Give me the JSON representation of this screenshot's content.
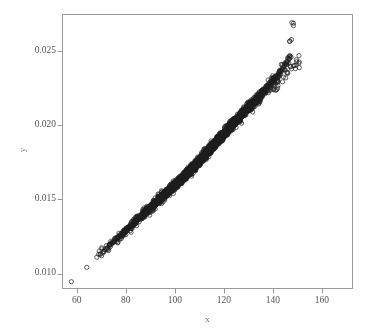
{
  "chart_data": {
    "type": "scatter",
    "title": "",
    "subtitle": "",
    "xlabel": "x",
    "ylabel": "y",
    "xlim": [
      54.2,
      172.5
    ],
    "ylim": [
      0.00899,
      0.02749
    ],
    "xticks": [
      60,
      80,
      100,
      120,
      140,
      160
    ],
    "xtick_labels": [
      "60",
      "80",
      "100",
      "120",
      "140",
      "160"
    ],
    "yticks": [
      0.01,
      0.015,
      0.02,
      0.025
    ],
    "ytick_labels": [
      "0.010",
      "0.015",
      "0.020",
      "0.025"
    ],
    "grid": false,
    "legend": null,
    "annotations": [],
    "marker": {
      "shape": "open-circle",
      "size_px": 4.2,
      "edge_color": "#1d1d1d",
      "fill_color": "none",
      "edge_width": 0.7
    },
    "axes_style": {
      "frame": "box",
      "frame_color": "#9a9a9a",
      "tick_direction": "out",
      "background": "#ffffff"
    },
    "relationship": {
      "description": "tight positive near-linear band",
      "approx_slope": 0.00016,
      "approx_intercept": 0.000195,
      "scatter_sd": 0.00013,
      "n_points": 640
    },
    "x": [
      57.8,
      64.1,
      68.2,
      69.6,
      70.9,
      72.1,
      73.3,
      74.2,
      75.1,
      75.8,
      76.6,
      77.3,
      78.0,
      78.6,
      79.2,
      79.8,
      80.4,
      80.9,
      81.4,
      81.9,
      82.4,
      82.9,
      83.3,
      83.8,
      84.2,
      84.6,
      85.0,
      85.4,
      85.8,
      86.2,
      86.5,
      86.9,
      87.2,
      87.6,
      87.9,
      88.3,
      88.6,
      88.9,
      89.2,
      89.5,
      89.8,
      90.1,
      90.4,
      90.7,
      91.0,
      91.3,
      91.5,
      91.8,
      92.1,
      92.3,
      92.6,
      92.8,
      93.1,
      93.3,
      93.6,
      93.8,
      94.1,
      94.3,
      94.5,
      94.8,
      95.0,
      95.2,
      95.4,
      95.7,
      95.9,
      96.1,
      96.3,
      96.5,
      96.7,
      96.9,
      97.1,
      97.3,
      97.5,
      97.7,
      97.9,
      98.1,
      98.3,
      98.5,
      98.7,
      98.9,
      99.1,
      99.3,
      99.5,
      99.6,
      99.8,
      100.0,
      100.2,
      100.4,
      100.5,
      100.7,
      100.9,
      101.1,
      101.2,
      101.4,
      101.6,
      101.7,
      101.9,
      102.1,
      102.2,
      102.4,
      102.6,
      102.7,
      102.9,
      103.0,
      103.2,
      103.4,
      103.5,
      103.7,
      103.8,
      104.0,
      104.1,
      104.3,
      104.4,
      104.6,
      104.7,
      104.9,
      105.0,
      105.2,
      105.3,
      105.5,
      105.6,
      105.8,
      105.9,
      106.1,
      106.2,
      106.4,
      106.5,
      106.6,
      106.8,
      106.9,
      107.1,
      107.2,
      107.3,
      107.5,
      107.6,
      107.8,
      107.9,
      108.0,
      108.2,
      108.3,
      108.4,
      108.6,
      108.7,
      108.8,
      109.0,
      109.1,
      109.2,
      109.4,
      109.5,
      109.6,
      109.8,
      109.9,
      110.0,
      110.1,
      110.3,
      110.4,
      110.5,
      110.7,
      110.8,
      110.9,
      111.0,
      111.2,
      111.3,
      111.4,
      111.5,
      111.7,
      111.8,
      111.9,
      112.0,
      112.2,
      112.3,
      112.4,
      112.5,
      112.7,
      112.8,
      112.9,
      113.0,
      113.2,
      113.3,
      113.4,
      113.5,
      113.6,
      113.8,
      113.9,
      114.0,
      114.1,
      114.3,
      114.4,
      114.5,
      114.6,
      114.7,
      114.9,
      115.0,
      115.1,
      115.2,
      115.3,
      115.5,
      115.6,
      115.7,
      115.8,
      115.9,
      116.1,
      116.2,
      116.3,
      116.4,
      116.5,
      116.7,
      116.8,
      116.9,
      117.0,
      117.1,
      117.3,
      117.4,
      117.5,
      117.6,
      117.7,
      117.9,
      118.0,
      118.1,
      118.2,
      118.3,
      118.5,
      118.6,
      118.7,
      118.8,
      118.9,
      119.1,
      119.2,
      119.3,
      119.4,
      119.5,
      119.7,
      119.8,
      119.9,
      120.0,
      120.2,
      120.3,
      120.4,
      120.5,
      120.7,
      120.8,
      120.9,
      121.0,
      121.2,
      121.3,
      121.4,
      121.5,
      121.7,
      121.8,
      121.9,
      122.0,
      122.2,
      122.3,
      122.4,
      122.6,
      122.7,
      122.8,
      122.9,
      123.1,
      123.2,
      123.3,
      123.5,
      123.6,
      123.7,
      123.9,
      124.0,
      124.1,
      124.3,
      124.4,
      124.5,
      124.7,
      124.8,
      124.9,
      125.1,
      125.2,
      125.3,
      125.5,
      125.6,
      125.8,
      125.9,
      126.0,
      126.2,
      126.3,
      126.5,
      126.6,
      126.8,
      126.9,
      127.0,
      127.2,
      127.3,
      127.5,
      127.6,
      127.8,
      127.9,
      128.1,
      128.2,
      128.4,
      128.5,
      128.7,
      128.9,
      129.0,
      129.2,
      129.3,
      129.5,
      129.7,
      129.8,
      130.0,
      130.2,
      130.3,
      130.5,
      130.7,
      130.8,
      131.0,
      131.2,
      131.4,
      131.5,
      131.7,
      131.9,
      132.1,
      132.3,
      132.5,
      132.6,
      132.8,
      133.0,
      133.2,
      133.4,
      133.6,
      133.8,
      134.0,
      134.3,
      134.5,
      134.7,
      134.9,
      135.1,
      135.4,
      135.6,
      135.8,
      136.1,
      136.3,
      136.6,
      136.8,
      137.1,
      137.3,
      137.6,
      137.9,
      138.2,
      138.5,
      138.8,
      139.1,
      139.4,
      139.7,
      140.0,
      140.4,
      140.7,
      141.1,
      141.5,
      141.9,
      142.3,
      142.7,
      143.1,
      143.6,
      144.1,
      144.6,
      145.1,
      145.7,
      146.3,
      146.9,
      147.6,
      148.4,
      149.2,
      150.1,
      151.1,
      159.9,
      166.9
    ],
    "y": [
      0.00945,
      0.01042,
      0.0111,
      0.01129,
      0.0115,
      0.01168,
      0.01186,
      0.01199,
      0.01213,
      0.01224,
      0.01236,
      0.01247,
      0.01258,
      0.01267,
      0.01276,
      0.01286,
      0.01295,
      0.01303,
      0.01311,
      0.01318,
      0.01326,
      0.01334,
      0.0134,
      0.01348,
      0.01354,
      0.01361,
      0.01367,
      0.01373,
      0.01379,
      0.01385,
      0.0139,
      0.01396,
      0.01401,
      0.01407,
      0.01412,
      0.01417,
      0.01422,
      0.01427,
      0.01432,
      0.01436,
      0.01441,
      0.01445,
      0.0145,
      0.01454,
      0.01459,
      0.01464,
      0.01467,
      0.01471,
      0.01476,
      0.01479,
      0.01483,
      0.01486,
      0.0149,
      0.01494,
      0.01498,
      0.01501,
      0.01505,
      0.01508,
      0.01511,
      0.01515,
      0.01518,
      0.01521,
      0.01524,
      0.01528,
      0.01531,
      0.01534,
      0.01537,
      0.0154,
      0.01543,
      0.01546,
      0.01549,
      0.01552,
      0.01555,
      0.01558,
      0.01561,
      0.01564,
      0.01567,
      0.0157,
      0.01573,
      0.01576,
      0.01579,
      0.01582,
      0.01585,
      0.01587,
      0.0159,
      0.01593,
      0.01596,
      0.01599,
      0.01601,
      0.01604,
      0.01607,
      0.0161,
      0.01612,
      0.01615,
      0.01618,
      0.0162,
      0.01623,
      0.01626,
      0.01628,
      0.01631,
      0.01634,
      0.01636,
      0.01639,
      0.01641,
      0.01644,
      0.01647,
      0.01649,
      0.01652,
      0.01654,
      0.01657,
      0.01659,
      0.01662,
      0.01664,
      0.01667,
      0.01669,
      0.01672,
      0.01674,
      0.01677,
      0.01679,
      0.01682,
      0.01684,
      0.01687,
      0.01689,
      0.01692,
      0.01694,
      0.01697,
      0.01699,
      0.01702,
      0.01704,
      0.01706,
      0.01709,
      0.01711,
      0.01714,
      0.01716,
      0.01718,
      0.01721,
      0.01723,
      0.01726,
      0.01728,
      0.0173,
      0.01733,
      0.01735,
      0.01737,
      0.0174,
      0.01742,
      0.01744,
      0.01747,
      0.01749,
      0.01751,
      0.01754,
      0.01756,
      0.01758,
      0.01761,
      0.01763,
      0.01765,
      0.01767,
      0.0177,
      0.01772,
      0.01774,
      0.01777,
      0.01779,
      0.01781,
      0.01783,
      0.01786,
      0.01788,
      0.0179,
      0.01792,
      0.01795,
      0.01797,
      0.01799,
      0.01801,
      0.01804,
      0.01806,
      0.01808,
      0.0181,
      0.01813,
      0.01815,
      0.01817,
      0.01819,
      0.01822,
      0.01824,
      0.01826,
      0.01828,
      0.0183,
      0.01833,
      0.01835,
      0.01837,
      0.01839,
      0.01842,
      0.01844,
      0.01846,
      0.01848,
      0.0185,
      0.01853,
      0.01855,
      0.01857,
      0.01859,
      0.01861,
      0.01864,
      0.01866,
      0.01868,
      0.0187,
      0.01872,
      0.01875,
      0.01877,
      0.01879,
      0.01881,
      0.01883,
      0.01886,
      0.01888,
      0.0189,
      0.01892,
      0.01894,
      0.01897,
      0.01899,
      0.01901,
      0.01903,
      0.01905,
      0.01908,
      0.0191,
      0.01912,
      0.01914,
      0.01916,
      0.01919,
      0.01921,
      0.01923,
      0.01925,
      0.01928,
      0.0193,
      0.01932,
      0.01934,
      0.01936,
      0.01939,
      0.01941,
      0.01943,
      0.01945,
      0.01948,
      0.0195,
      0.01952,
      0.01954,
      0.01957,
      0.01959,
      0.01961,
      0.01963,
      0.01966,
      0.01968,
      0.0197,
      0.01972,
      0.01975,
      0.01977,
      0.01979,
      0.01982,
      0.01984,
      0.01986,
      0.01988,
      0.01991,
      0.01993,
      0.01995,
      0.01998,
      0.02,
      0.02002,
      0.02005,
      0.02007,
      0.02009,
      0.02012,
      0.02014,
      0.02016,
      0.02019,
      0.02021,
      0.02023,
      0.02026,
      0.02028,
      0.02031,
      0.02033,
      0.02035,
      0.02038,
      0.0204,
      0.02043,
      0.02045,
      0.02048,
      0.0205,
      0.02053,
      0.02055,
      0.02058,
      0.0206,
      0.02063,
      0.02065,
      0.02068,
      0.0207,
      0.02073,
      0.02075,
      0.02078,
      0.02081,
      0.02083,
      0.02086,
      0.02089,
      0.02091,
      0.02094,
      0.02097,
      0.02099,
      0.02102,
      0.02105,
      0.02108,
      0.0211,
      0.02113,
      0.02116,
      0.02119,
      0.02122,
      0.02125,
      0.02128,
      0.02131,
      0.02134,
      0.02137,
      0.0214,
      0.02143,
      0.02146,
      0.02149,
      0.02153,
      0.02156,
      0.02159,
      0.02162,
      0.02166,
      0.02169,
      0.02173,
      0.02176,
      0.0218,
      0.02183,
      0.02187,
      0.02191,
      0.02194,
      0.02198,
      0.02202,
      0.02206,
      0.0221,
      0.02214,
      0.02218,
      0.02222,
      0.02227,
      0.02231,
      0.02236,
      0.0224,
      0.02245,
      0.0225,
      0.02255,
      0.0226,
      0.02265,
      0.02271,
      0.02276,
      0.02282,
      0.02288,
      0.02295,
      0.02301,
      0.02308,
      0.02315,
      0.02323,
      0.02331,
      0.02339,
      0.02348,
      0.02358,
      0.02368,
      0.02379,
      0.02391,
      0.02404,
      0.02418,
      0.02434,
      0.02452,
      0.02472,
      0.0258,
      0.0269
    ]
  }
}
